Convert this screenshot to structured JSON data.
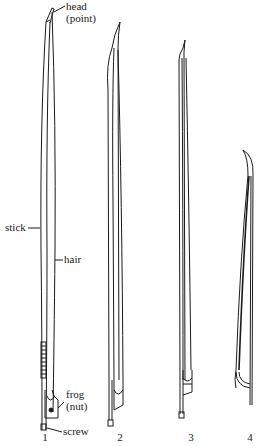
{
  "diagram": {
    "labels": {
      "head": "head",
      "point": "(point)",
      "stick": "stick",
      "hair": "hair",
      "frog": "frog",
      "nut": "(nut)",
      "screw": "screw"
    },
    "figures": [
      {
        "number": "1"
      },
      {
        "number": "2"
      },
      {
        "number": "3"
      },
      {
        "number": "4"
      }
    ],
    "colors": {
      "ink": "#1a1a1a",
      "background": "#ffffff"
    }
  }
}
